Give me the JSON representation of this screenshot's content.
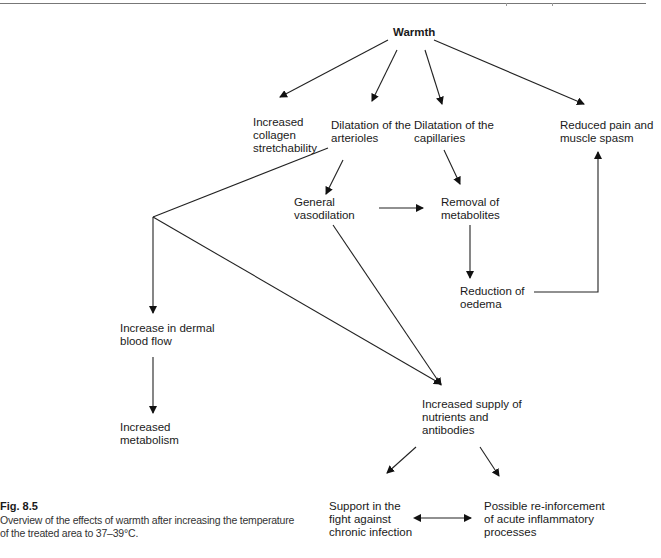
{
  "figure": {
    "label": "Fig. 8.5",
    "caption": "Overview of the effects of warmth after increasing the temperature of the treated area to 37–39°C."
  },
  "nodes": {
    "warmth": "Warmth",
    "collagen": "Increased\ncollagen\nstretchability",
    "arterioles": "Dilatation of the\narterioles",
    "capillaries": "Dilatation of the\ncapillaries",
    "pain": "Reduced pain and\nmuscle spasm",
    "vasodilation": "General\nvasodilation",
    "metabolites": "Removal of\nmetabolites",
    "oedema": "Reduction of\noedema",
    "dermal": "Increase in dermal\nblood flow",
    "metabolism": "Increased\nmetabolism",
    "supply": "Increased supply of\nnutrients and\nantibodies",
    "chronic": "Support in the\nfight against\nchronic infection",
    "acute": "Possible re-inforcement\nof acute inflammatory\nprocesses"
  },
  "edges": [
    [
      "warmth",
      "collagen"
    ],
    [
      "warmth",
      "arterioles"
    ],
    [
      "warmth",
      "capillaries"
    ],
    [
      "warmth",
      "pain"
    ],
    [
      "arterioles",
      "vasodilation"
    ],
    [
      "arterioles",
      "dermal"
    ],
    [
      "arterioles",
      "supply"
    ],
    [
      "capillaries",
      "metabolites"
    ],
    [
      "vasodilation",
      "metabolites"
    ],
    [
      "vasodilation",
      "supply"
    ],
    [
      "metabolites",
      "oedema"
    ],
    [
      "oedema",
      "pain"
    ],
    [
      "dermal",
      "metabolism"
    ],
    [
      "supply",
      "chronic"
    ],
    [
      "supply",
      "acute"
    ],
    [
      "chronic",
      "acute",
      "bidirectional"
    ]
  ]
}
